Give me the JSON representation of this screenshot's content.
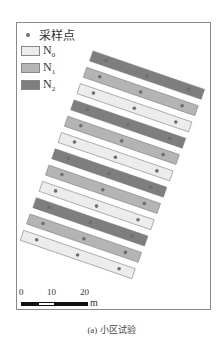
{
  "legend": {
    "sample": "采样点",
    "items": [
      {
        "label": "N",
        "sub": "0",
        "color": "#ececec"
      },
      {
        "label": "N",
        "sub": "1",
        "color": "#b4b4b4"
      },
      {
        "label": "N",
        "sub": "2",
        "color": "#7e7e7e"
      }
    ]
  },
  "plots": [
    "N2",
    "N1",
    "N0",
    "N2",
    "N1",
    "N0",
    "N2",
    "N1",
    "N0",
    "N2",
    "N1",
    "N0"
  ],
  "points_per_plot": 3,
  "scale_bar": {
    "ticks": [
      "0",
      "10",
      "20"
    ],
    "unit": "m"
  },
  "caption": "(a) 小区试验",
  "colors": {
    "N0": "#ececec",
    "N1": "#b4b4b4",
    "N2": "#7e7e7e",
    "point": "#6d6d6d",
    "border": "#8a8a8a"
  }
}
